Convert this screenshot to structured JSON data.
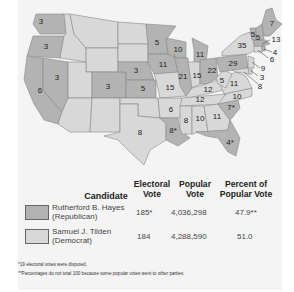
{
  "colors": {
    "republican": "#b3b3b3",
    "democrat": "#d8d8d8",
    "border": "#888888",
    "background": "#f4f4f4"
  },
  "map": {
    "title": "Election of 1876",
    "states": [
      {
        "name": "Washington",
        "votes": "3",
        "party": "republican"
      },
      {
        "name": "Oregon",
        "votes": "3",
        "party": "republican"
      },
      {
        "name": "California",
        "votes": "6",
        "party": "republican"
      },
      {
        "name": "Nevada",
        "votes": "3",
        "party": "republican"
      },
      {
        "name": "Colorado",
        "votes": "3",
        "party": "republican"
      },
      {
        "name": "Nebraska",
        "votes": "3",
        "party": "republican"
      },
      {
        "name": "Kansas",
        "votes": "5",
        "party": "republican"
      },
      {
        "name": "Texas",
        "votes": "8",
        "party": "democrat"
      },
      {
        "name": "Minnesota",
        "votes": "5",
        "party": "republican"
      },
      {
        "name": "Iowa",
        "votes": "11",
        "party": "republican"
      },
      {
        "name": "Missouri",
        "votes": "15",
        "party": "democrat"
      },
      {
        "name": "Arkansas",
        "votes": "6",
        "party": "democrat"
      },
      {
        "name": "Louisiana",
        "votes": "8*",
        "party": "republican"
      },
      {
        "name": "Wisconsin",
        "votes": "10",
        "party": "republican"
      },
      {
        "name": "Illinois",
        "votes": "21",
        "party": "republican"
      },
      {
        "name": "Michigan",
        "votes": "11",
        "party": "republican"
      },
      {
        "name": "Indiana",
        "votes": "15",
        "party": "democrat"
      },
      {
        "name": "Ohio",
        "votes": "22",
        "party": "republican"
      },
      {
        "name": "Kentucky",
        "votes": "12",
        "party": "democrat"
      },
      {
        "name": "Tennessee",
        "votes": "12",
        "party": "democrat"
      },
      {
        "name": "Mississippi",
        "votes": "8",
        "party": "democrat"
      },
      {
        "name": "Alabama",
        "votes": "10",
        "party": "democrat"
      },
      {
        "name": "Georgia",
        "votes": "11",
        "party": "democrat"
      },
      {
        "name": "Florida",
        "votes": "4*",
        "party": "republican"
      },
      {
        "name": "South Carolina",
        "votes": "7*",
        "party": "republican"
      },
      {
        "name": "North Carolina",
        "votes": "10",
        "party": "democrat"
      },
      {
        "name": "Virginia",
        "votes": "11",
        "party": "democrat"
      },
      {
        "name": "West Virginia",
        "votes": "5",
        "party": "democrat"
      },
      {
        "name": "Pennsylvania",
        "votes": "29",
        "party": "republican"
      },
      {
        "name": "New York",
        "votes": "35",
        "party": "democrat"
      },
      {
        "name": "Vermont",
        "votes": "5",
        "party": "republican"
      },
      {
        "name": "New Hampshire",
        "votes": "5",
        "party": "republican"
      },
      {
        "name": "Maine",
        "votes": "7",
        "party": "republican"
      },
      {
        "name": "Massachusetts",
        "votes": "13",
        "party": "republican"
      },
      {
        "name": "Rhode Island",
        "votes": "4",
        "party": "republican"
      },
      {
        "name": "Connecticut",
        "votes": "6",
        "party": "democrat"
      },
      {
        "name": "New Jersey",
        "votes": "9",
        "party": "democrat"
      },
      {
        "name": "Delaware",
        "votes": "3",
        "party": "democrat"
      },
      {
        "name": "Maryland",
        "votes": "8",
        "party": "democrat"
      }
    ]
  },
  "table": {
    "headers": {
      "candidate": "Candidate",
      "electoral_1": "Electoral",
      "electoral_2": "Vote",
      "popular_1": "Popular",
      "popular_2": "Vote",
      "percent_1": "Percent of",
      "percent_2": "Popular Vote"
    },
    "rows": [
      {
        "name": "Rutherford B. Hayes",
        "party": "(Republican)",
        "electoral": "185*",
        "popular": "4,036,298",
        "percent": "47.9**"
      },
      {
        "name": "Samuel J. Tilden",
        "party": "(Democrat)",
        "electoral": "184",
        "popular": "4,288,590",
        "percent": "51.0"
      }
    ]
  },
  "notes": [
    "*19 electoral votes were disputed.",
    "**Percentages do not total 100 because some popular votes went to other parties."
  ]
}
